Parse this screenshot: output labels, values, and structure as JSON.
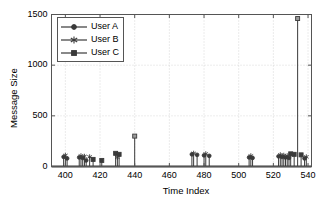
{
  "chart_data": {
    "type": "bar",
    "title": "",
    "xlabel": "Time Index",
    "ylabel": "Message Size",
    "xlim": [
      392,
      542
    ],
    "ylim": [
      0,
      1500
    ],
    "xticks": [
      400,
      420,
      440,
      460,
      480,
      500,
      520,
      540
    ],
    "yticks": [
      0,
      500,
      1000,
      1500
    ],
    "grid": true,
    "legend_position": "top-left",
    "series": [
      {
        "name": "User A",
        "marker": "circle",
        "color": "#3a3a3a",
        "points": [
          {
            "x": 399,
            "y": 95
          },
          {
            "x": 401,
            "y": 80
          },
          {
            "x": 408,
            "y": 90
          },
          {
            "x": 410,
            "y": 85
          },
          {
            "x": 412,
            "y": 60
          },
          {
            "x": 473,
            "y": 120
          },
          {
            "x": 476,
            "y": 115
          },
          {
            "x": 480,
            "y": 110
          },
          {
            "x": 483,
            "y": 105
          },
          {
            "x": 506,
            "y": 90
          },
          {
            "x": 508,
            "y": 85
          },
          {
            "x": 523,
            "y": 100
          },
          {
            "x": 525,
            "y": 95
          },
          {
            "x": 527,
            "y": 90
          },
          {
            "x": 529,
            "y": 85
          },
          {
            "x": 538,
            "y": 80
          }
        ]
      },
      {
        "name": "User B",
        "marker": "star",
        "color": "#3a3a3a",
        "points": [
          {
            "x": 400,
            "y": 110
          },
          {
            "x": 409,
            "y": 105
          },
          {
            "x": 411,
            "y": 100
          },
          {
            "x": 414,
            "y": 95
          },
          {
            "x": 430,
            "y": 90
          },
          {
            "x": 474,
            "y": 130
          },
          {
            "x": 481,
            "y": 125
          },
          {
            "x": 507,
            "y": 105
          },
          {
            "x": 524,
            "y": 115
          },
          {
            "x": 526,
            "y": 110
          },
          {
            "x": 528,
            "y": 105
          },
          {
            "x": 539,
            "y": 95
          }
        ]
      },
      {
        "name": "User C",
        "marker": "square",
        "color": "#3a3a3a",
        "points": [
          {
            "x": 416,
            "y": 70
          },
          {
            "x": 421,
            "y": 60
          },
          {
            "x": 429,
            "y": 130
          },
          {
            "x": 431,
            "y": 120
          },
          {
            "x": 440,
            "y": 300
          },
          {
            "x": 530,
            "y": 125
          },
          {
            "x": 532,
            "y": 120
          },
          {
            "x": 534,
            "y": 1460
          },
          {
            "x": 536,
            "y": 115
          }
        ]
      }
    ],
    "peak_annotation": {
      "x": 534,
      "y": 1460,
      "series": "User C"
    }
  },
  "legend": {
    "items": [
      {
        "label": "User A",
        "marker": "circle"
      },
      {
        "label": "User B",
        "marker": "star"
      },
      {
        "label": "User C",
        "marker": "square"
      }
    ]
  },
  "axes": {
    "y_tick_labels": [
      "1500",
      "1000",
      "500",
      "0"
    ],
    "x_tick_labels": [
      "400",
      "420",
      "440",
      "460",
      "480",
      "500",
      "520",
      "540"
    ],
    "ylabel": "Message Size",
    "xlabel": "Time Index"
  }
}
